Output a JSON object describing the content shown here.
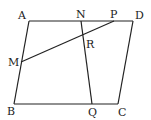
{
  "diagram": {
    "type": "geometry",
    "points": {
      "A": {
        "label": "A",
        "x": 29,
        "y": 21
      },
      "D": {
        "label": "D",
        "x": 133,
        "y": 21
      },
      "B": {
        "label": "B",
        "x": 14,
        "y": 104
      },
      "C": {
        "label": "C",
        "x": 118,
        "y": 104
      },
      "N": {
        "label": "N",
        "x": 81,
        "y": 21
      },
      "P": {
        "label": "P",
        "x": 114,
        "y": 21
      },
      "M": {
        "label": "M",
        "x": 21,
        "y": 62
      },
      "Q": {
        "label": "Q",
        "x": 92,
        "y": 104
      },
      "R": {
        "label": "R",
        "x": 83,
        "y": 37
      }
    },
    "segments": [
      [
        "A",
        "D"
      ],
      [
        "D",
        "C"
      ],
      [
        "C",
        "B"
      ],
      [
        "B",
        "A"
      ],
      [
        "M",
        "P"
      ],
      [
        "N",
        "Q"
      ]
    ],
    "labels": {
      "A": "A",
      "B": "B",
      "C": "C",
      "D": "D",
      "M": "M",
      "N": "N",
      "P": "P",
      "Q": "Q",
      "R": "R"
    }
  }
}
